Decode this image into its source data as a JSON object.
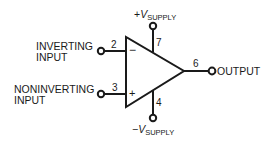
{
  "diagram": {
    "inputs": {
      "inverting": {
        "label_line1": "INVERTING",
        "label_line2": "INPUT",
        "pin": "2",
        "sign": "−"
      },
      "noninverting": {
        "label_line1": "NONINVERTING",
        "label_line2": "INPUT",
        "pin": "3",
        "sign": "+"
      }
    },
    "supply": {
      "positive": {
        "prefix": "+",
        "v": "V",
        "sub": "SUPPLY",
        "pin": "7"
      },
      "negative": {
        "prefix": "−",
        "v": "V",
        "sub": "SUPPLY",
        "pin": "4"
      }
    },
    "output": {
      "label": "OUTPUT",
      "pin": "6"
    },
    "colors": {
      "stroke": "#1a1a1a",
      "background": "#ffffff"
    }
  }
}
